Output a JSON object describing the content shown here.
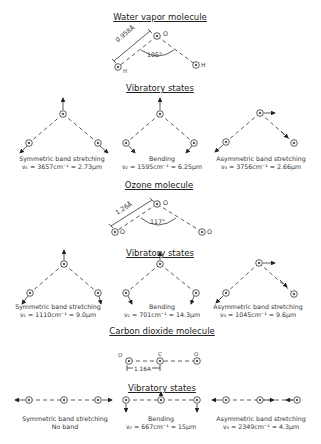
{
  "water": {
    "title": "Water vapor molecule",
    "bond_length": "0.958Å",
    "angle": "105°",
    "atoms": {
      "center": "O",
      "left": "H",
      "right": "H"
    },
    "vib_title": "Vibratory states",
    "modes": [
      {
        "name": "Symmetric band stretching",
        "formula": "ν₁ = 3657cm⁻¹ = 2.73μm"
      },
      {
        "name": "Bending",
        "formula": "ν₂ = 1595cm⁻¹ = 6.25μm"
      },
      {
        "name": "Asymmetric band stretching",
        "formula": "ν₃ = 3756cm⁻¹ = 2.66μm"
      }
    ]
  },
  "ozone": {
    "title": "Ozone molecule",
    "bond_length": "1.26Å",
    "angle": "117°",
    "atoms": {
      "center": "O",
      "left": "O",
      "right": "O"
    },
    "vib_title": "Vibratory states",
    "modes": [
      {
        "name": "Symmetric band stretching",
        "formula": "ν₁ = 1110cm⁻¹ = 9.0μm"
      },
      {
        "name": "Bending",
        "formula": "ν₂ = 701cm⁻¹ = 14.3μm"
      },
      {
        "name": "Asymmetric band stretching",
        "formula": "ν₃ = 1045cm⁻¹ = 9.6μm"
      }
    ]
  },
  "co2": {
    "title": "Carbon dioxide molecule",
    "bond_length": "1.16A",
    "atoms": {
      "left": "O",
      "center": "C",
      "right": "O"
    },
    "vib_title": "Vibratory states",
    "modes": [
      {
        "name": "Symmetric band stretching",
        "formula": "No band"
      },
      {
        "name": "Bending",
        "formula": "ν₂ = 667cm⁻¹ = 15μm"
      },
      {
        "name": "Asymmetric band stretching",
        "formula": "ν₃ = 2349cm⁻¹ = 4.3μm"
      }
    ]
  }
}
